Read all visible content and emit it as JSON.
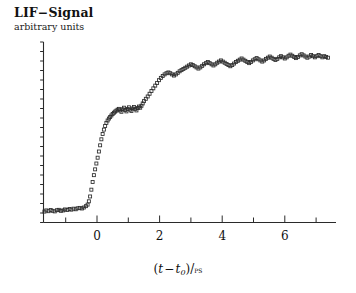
{
  "figure": {
    "title": "LIF−Signal",
    "subtitle": "arbitrary units",
    "xlabel_t": "t",
    "xlabel_minus": "−",
    "xlabel_t0": "t",
    "xlabel_zero": "0",
    "xlabel_slash": ")/",
    "xlabel_open": "(",
    "xlabel_close": ")",
    "xlabel_unit": "ps",
    "marker": "open-square"
  },
  "chart_data": {
    "type": "scatter",
    "title": "LIF−Signal",
    "subtitle": "arbitrary units",
    "xlabel": "(t - t0)/ps",
    "ylabel": "LIF-Signal (arbitrary units)",
    "xlim": [
      -1.85,
      7.7
    ],
    "ylim": [
      0,
      1.12
    ],
    "grid": false,
    "legend": null,
    "xticks_major": [
      0,
      2,
      4,
      6
    ],
    "xtick_labels": [
      "0",
      "2",
      "4",
      "6"
    ],
    "xticks_minor": [
      -1,
      1,
      3,
      5,
      7
    ],
    "yticks_minor_count": 19,
    "marker_style": "open square",
    "marker_size_px": 3,
    "x": [
      -1.75,
      -1.68,
      -1.62,
      -1.55,
      -1.48,
      -1.42,
      -1.35,
      -1.28,
      -1.22,
      -1.15,
      -1.08,
      -1.02,
      -0.95,
      -0.88,
      -0.82,
      -0.75,
      -0.68,
      -0.62,
      -0.55,
      -0.48,
      -0.42,
      -0.35,
      -0.3,
      -0.26,
      -0.22,
      -0.18,
      -0.14,
      -0.1,
      -0.06,
      -0.02,
      0.02,
      0.06,
      0.1,
      0.14,
      0.18,
      0.22,
      0.26,
      0.3,
      0.34,
      0.38,
      0.42,
      0.46,
      0.5,
      0.54,
      0.58,
      0.62,
      0.66,
      0.7,
      0.74,
      0.78,
      0.82,
      0.86,
      0.9,
      0.94,
      0.98,
      1.02,
      1.06,
      1.1,
      1.14,
      1.18,
      1.22,
      1.26,
      1.3,
      1.34,
      1.38,
      1.42,
      1.46,
      1.5,
      1.56,
      1.62,
      1.68,
      1.74,
      1.8,
      1.86,
      1.92,
      1.98,
      2.04,
      2.1,
      2.16,
      2.22,
      2.28,
      2.34,
      2.4,
      2.46,
      2.52,
      2.58,
      2.64,
      2.7,
      2.76,
      2.82,
      2.88,
      2.94,
      3.0,
      3.06,
      3.12,
      3.18,
      3.24,
      3.3,
      3.36,
      3.42,
      3.48,
      3.54,
      3.6,
      3.66,
      3.72,
      3.78,
      3.84,
      3.9,
      3.96,
      4.02,
      4.08,
      4.14,
      4.2,
      4.26,
      4.32,
      4.38,
      4.44,
      4.5,
      4.56,
      4.62,
      4.68,
      4.74,
      4.8,
      4.86,
      4.92,
      4.98,
      5.04,
      5.1,
      5.16,
      5.22,
      5.28,
      5.34,
      5.4,
      5.46,
      5.52,
      5.58,
      5.64,
      5.7,
      5.76,
      5.82,
      5.88,
      5.94,
      6.0,
      6.06,
      6.12,
      6.18,
      6.24,
      6.3,
      6.36,
      6.42,
      6.48,
      6.54,
      6.6,
      6.66,
      6.72,
      6.78,
      6.84,
      6.9,
      6.96,
      7.02,
      7.08,
      7.14,
      7.2,
      7.26,
      7.32,
      7.38
    ],
    "y": [
      0.085,
      0.082,
      0.088,
      0.084,
      0.09,
      0.086,
      0.083,
      0.089,
      0.091,
      0.086,
      0.088,
      0.093,
      0.09,
      0.095,
      0.092,
      0.097,
      0.094,
      0.099,
      0.101,
      0.098,
      0.103,
      0.11,
      0.118,
      0.135,
      0.16,
      0.195,
      0.235,
      0.27,
      0.3,
      0.33,
      0.36,
      0.392,
      0.424,
      0.455,
      0.482,
      0.505,
      0.524,
      0.54,
      0.552,
      0.562,
      0.57,
      0.578,
      0.586,
      0.592,
      0.598,
      0.603,
      0.608,
      0.612,
      0.604,
      0.597,
      0.61,
      0.618,
      0.606,
      0.599,
      0.612,
      0.62,
      0.608,
      0.601,
      0.614,
      0.622,
      0.612,
      0.604,
      0.616,
      0.624,
      0.618,
      0.628,
      0.64,
      0.652,
      0.664,
      0.676,
      0.69,
      0.704,
      0.718,
      0.732,
      0.746,
      0.76,
      0.772,
      0.782,
      0.79,
      0.796,
      0.8,
      0.796,
      0.79,
      0.784,
      0.79,
      0.798,
      0.806,
      0.812,
      0.818,
      0.824,
      0.83,
      0.836,
      0.842,
      0.838,
      0.832,
      0.826,
      0.82,
      0.826,
      0.834,
      0.842,
      0.848,
      0.854,
      0.848,
      0.842,
      0.836,
      0.842,
      0.85,
      0.856,
      0.862,
      0.856,
      0.85,
      0.844,
      0.838,
      0.832,
      0.838,
      0.846,
      0.854,
      0.86,
      0.866,
      0.872,
      0.866,
      0.86,
      0.854,
      0.848,
      0.854,
      0.862,
      0.868,
      0.874,
      0.868,
      0.862,
      0.856,
      0.862,
      0.87,
      0.876,
      0.882,
      0.876,
      0.87,
      0.864,
      0.87,
      0.878,
      0.884,
      0.878,
      0.872,
      0.878,
      0.886,
      0.892,
      0.886,
      0.88,
      0.874,
      0.88,
      0.888,
      0.894,
      0.888,
      0.882,
      0.876,
      0.882,
      0.89,
      0.884,
      0.878,
      0.884,
      0.89,
      0.884,
      0.878,
      0.884,
      0.88,
      0.876
    ]
  }
}
